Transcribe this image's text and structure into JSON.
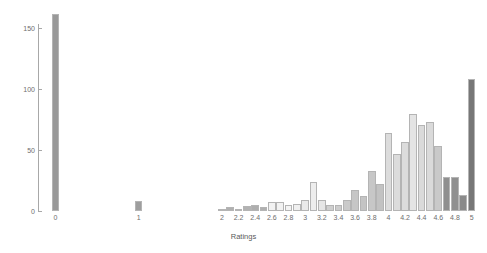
{
  "chart_data": {
    "type": "bar",
    "title": "",
    "subtitle": "",
    "xlabel": "Ratings",
    "ylabel": "",
    "xlim": [
      -0.125,
      5.125
    ],
    "ylim": [
      0,
      165
    ],
    "grid": false,
    "legend": null,
    "bar_border_color": "#b4b4b4",
    "axis_color": "#a8a8a8",
    "tick_label_color": "#6e6e6e",
    "background": "#ffffff",
    "yticks": [
      0,
      50,
      100,
      150
    ],
    "ytick_labels": [
      "0",
      "50",
      "100",
      "150"
    ],
    "xticks": [
      0,
      1,
      2,
      2.2,
      2.4,
      2.6,
      2.8,
      3,
      3.2,
      3.4,
      3.6,
      3.8,
      4,
      4.2,
      4.4,
      4.6,
      4.8,
      5
    ],
    "xtick_labels": [
      "0",
      "1",
      "2",
      "2.2",
      "2.4",
      "2.6",
      "2.8",
      "3",
      "3.2",
      "3.4",
      "3.6",
      "3.8",
      "4",
      "4.2",
      "4.4",
      "4.6",
      "4.8",
      "5"
    ],
    "categories": [
      "0",
      "1",
      "2",
      "2.1",
      "2.2",
      "2.3",
      "2.4",
      "2.5",
      "2.6",
      "2.7",
      "2.8",
      "2.9",
      "3",
      "3.1",
      "3.2",
      "3.3",
      "3.4",
      "3.5",
      "3.6",
      "3.7",
      "3.8",
      "3.9",
      "4",
      "4.1",
      "4.2",
      "4.3",
      "4.4",
      "4.5",
      "4.6",
      "4.7",
      "4.8",
      "4.9",
      "5"
    ],
    "x": [
      0,
      1,
      2,
      2.1,
      2.2,
      2.3,
      2.4,
      2.5,
      2.6,
      2.7,
      2.8,
      2.9,
      3,
      3.1,
      3.2,
      3.3,
      3.4,
      3.5,
      3.6,
      3.7,
      3.8,
      3.9,
      4,
      4.1,
      4.2,
      4.3,
      4.4,
      4.5,
      4.6,
      4.7,
      4.8,
      4.9,
      5
    ],
    "values": [
      162,
      8,
      2,
      3,
      2,
      4,
      5,
      3,
      7,
      7,
      5,
      6,
      9,
      24,
      9,
      5,
      5,
      9,
      17,
      12,
      33,
      22,
      64,
      47,
      57,
      80,
      71,
      73,
      53,
      28,
      28,
      13,
      108
    ],
    "bar_colors": [
      "#999999",
      "#9e9e9e",
      "#b5b5b5",
      "#b0b0b0",
      "#b8b8b8",
      "#b2b2b2",
      "#aeaeae",
      "#b0b0b0",
      "#f2f2f2",
      "#f2f2f2",
      "#f4f4f4",
      "#f0f0f0",
      "#eaeaea",
      "#ededed",
      "#e6e6e6",
      "#cfcfcf",
      "#cdcdcd",
      "#cacaca",
      "#c6c6c6",
      "#c4c4c4",
      "#c7c7c7",
      "#c2c2c2",
      "#dcdcdc",
      "#dcdcdc",
      "#dcdcdc",
      "#e4e4e4",
      "#dadada",
      "#dadada",
      "#c9c9c9",
      "#8f8f8f",
      "#8f8f8f",
      "#8a8a8a",
      "#777777"
    ]
  }
}
